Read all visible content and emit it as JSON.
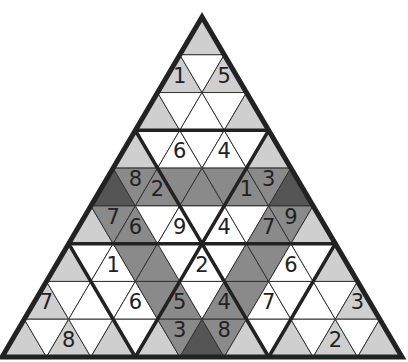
{
  "puzzle": {
    "type": "triangular-sudoku",
    "rows": 9,
    "colors": {
      "white": "#ffffff",
      "light": "#cfcfcf",
      "medium": "#8a8a8a",
      "dark": "#555555",
      "line": "#333333",
      "border": "#222222"
    },
    "cells": [
      [
        "L"
      ],
      [
        "L1",
        "W",
        "L5"
      ],
      [
        "L",
        "W",
        "W",
        "W",
        "L"
      ],
      [
        "L",
        "W",
        "W6",
        "W",
        "W4",
        "W",
        "L"
      ],
      [
        "D",
        "M8",
        "M2",
        "M",
        "M",
        "M",
        "M1",
        "M3",
        "D"
      ],
      [
        "L",
        "M7",
        "M6",
        "W",
        "W9",
        "W",
        "W4",
        "W",
        "M7",
        "M9",
        "L"
      ],
      [
        "L",
        "W",
        "W1",
        "M",
        "M",
        "W",
        "W2",
        "W",
        "M",
        "M",
        "W6",
        "W",
        "L"
      ],
      [
        "L7",
        "W",
        "W",
        "W",
        "W6",
        "M",
        "M5",
        "W",
        "M4",
        "M",
        "W7",
        "W",
        "W",
        "W",
        "L3"
      ],
      [
        "L",
        "W",
        "L8",
        "W",
        "L",
        "W",
        "L",
        "M3",
        "D",
        "M8",
        "L",
        "W",
        "L",
        "W",
        "L2",
        "W",
        "L"
      ]
    ]
  }
}
